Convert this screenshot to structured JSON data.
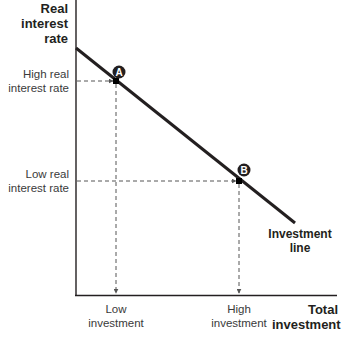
{
  "diagram": {
    "y_axis_title": [
      "Real interest",
      "rate"
    ],
    "x_axis_title": [
      "Total",
      "investment"
    ],
    "line_label": [
      "Investment",
      "line"
    ],
    "y_ticks": [
      {
        "lines": [
          "High real",
          "interest rate"
        ]
      },
      {
        "lines": [
          "Low real",
          "interest rate"
        ]
      }
    ],
    "x_ticks": [
      {
        "lines": [
          "Low",
          "investment"
        ]
      },
      {
        "lines": [
          "High",
          "investment"
        ]
      }
    ],
    "points": [
      {
        "id": "A",
        "x": 116,
        "y": 81,
        "description": "High real interest rate, low investment"
      },
      {
        "id": "B",
        "x": 239,
        "y": 181,
        "description": "Low real interest rate, high investment"
      }
    ],
    "line": {
      "x1": 76,
      "y1": 48,
      "x2": 295,
      "y2": 223,
      "slope": "negative"
    },
    "colors": {
      "axis": "#231f20",
      "line": "#231f20",
      "dashed": "#555555",
      "point_badge": "#231f20"
    }
  }
}
